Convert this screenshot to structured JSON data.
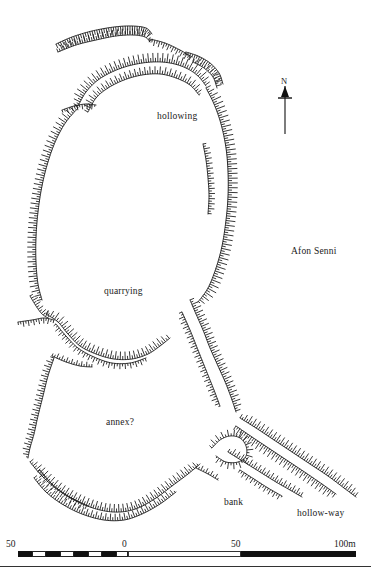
{
  "figure": {
    "kind": "archaeological-earthwork-survey-plan",
    "width": 371,
    "height": 574,
    "background_color": "#ffffff",
    "ink_color": "#111111"
  },
  "labels": [
    {
      "name": "hollowing",
      "text": "hollowing",
      "x": 157,
      "y": 111
    },
    {
      "name": "afon-senni",
      "text": "Afon Senni",
      "x": 291,
      "y": 246
    },
    {
      "name": "quarrying",
      "text": "quarrying",
      "x": 104,
      "y": 286
    },
    {
      "name": "annex",
      "text": "annex?",
      "x": 106,
      "y": 417
    },
    {
      "name": "bank",
      "text": "bank",
      "x": 224,
      "y": 497
    },
    {
      "name": "hollow-way",
      "text": "hollow-way",
      "x": 297,
      "y": 508
    }
  ],
  "north_arrow": {
    "label": "N",
    "label_x": 281,
    "label_y": 76,
    "shaft_x": 285,
    "shaft_top": 86,
    "shaft_bottom": 134,
    "head_half_width": 4,
    "head_height": 11,
    "crossbar_y": 98,
    "crossbar_half_width": 7
  },
  "scale_bar": {
    "unit_suffix": "m",
    "ticks": [
      {
        "text": "50",
        "x": 6,
        "y": 539
      },
      {
        "text": "0",
        "x": 122,
        "y": 539
      },
      {
        "text": "50",
        "x": 231,
        "y": 539
      },
      {
        "text": "100m",
        "x": 334,
        "y": 539
      }
    ],
    "bar_left": 18,
    "bar_width": 338,
    "bar_top": 551,
    "bar_height": 6,
    "segments": [
      {
        "style": "black",
        "left": 0,
        "width": 14
      },
      {
        "style": "white",
        "left": 14,
        "width": 14
      },
      {
        "style": "black",
        "left": 28,
        "width": 14
      },
      {
        "style": "white",
        "left": 42,
        "width": 14
      },
      {
        "style": "black",
        "left": 56,
        "width": 14
      },
      {
        "style": "white",
        "left": 70,
        "width": 14
      },
      {
        "style": "black",
        "left": 84,
        "width": 14
      },
      {
        "style": "white",
        "left": 98,
        "width": 12
      },
      {
        "style": "outline",
        "left": 110,
        "width": 113
      },
      {
        "style": "black",
        "left": 223,
        "width": 115
      }
    ]
  },
  "hachure_style": {
    "stroke_color": "#151515",
    "baseline_width": 0.9,
    "tick_width": 0.85,
    "default_spacing": 2.6,
    "default_tick_length": 7
  },
  "earthworks": [
    {
      "name": "north-outer-bank",
      "side": -1,
      "spacing": 2.4,
      "tick": 8,
      "taper": 0.55,
      "baseline": [
        [
          56,
          44
        ],
        [
          72,
          37
        ],
        [
          92,
          31
        ],
        [
          114,
          27
        ],
        [
          132,
          26
        ],
        [
          146,
          28
        ],
        [
          152,
          34
        ]
      ]
    },
    {
      "name": "north-outer-bank-lower",
      "side": 1,
      "spacing": 2.4,
      "tick": 6.5,
      "taper": 0.6,
      "baseline": [
        [
          58,
          52
        ],
        [
          76,
          45
        ],
        [
          96,
          40
        ],
        [
          116,
          36
        ],
        [
          133,
          35
        ],
        [
          145,
          37
        ],
        [
          150,
          42
        ]
      ]
    },
    {
      "name": "north-spur-east",
      "side": -1,
      "spacing": 2.5,
      "tick": 6,
      "taper": 0.5,
      "baseline": [
        [
          150,
          39
        ],
        [
          165,
          43
        ],
        [
          180,
          50
        ],
        [
          192,
          57
        ]
      ]
    },
    {
      "name": "north-inner-rampart-outer",
      "side": 1,
      "spacing": 2.3,
      "tick": 9,
      "taper": 0.45,
      "baseline": [
        [
          78,
          106
        ],
        [
          86,
          92
        ],
        [
          98,
          80
        ],
        [
          114,
          71
        ],
        [
          132,
          65
        ],
        [
          152,
          62
        ],
        [
          170,
          63
        ],
        [
          186,
          68
        ],
        [
          198,
          76
        ],
        [
          206,
          86
        ]
      ]
    },
    {
      "name": "north-inner-rampart-inner",
      "side": 1,
      "spacing": 2.4,
      "tick": 7.5,
      "taper": 0.5,
      "baseline": [
        [
          88,
          112
        ],
        [
          96,
          98
        ],
        [
          108,
          88
        ],
        [
          124,
          80
        ],
        [
          142,
          75
        ],
        [
          160,
          74
        ],
        [
          176,
          78
        ],
        [
          190,
          85
        ],
        [
          199,
          95
        ]
      ]
    },
    {
      "name": "north-east-scarp",
      "side": -1,
      "spacing": 2.4,
      "tick": 6.5,
      "taper": 0.5,
      "baseline": [
        [
          186,
          52
        ],
        [
          198,
          56
        ],
        [
          210,
          63
        ],
        [
          219,
          73
        ],
        [
          223,
          84
        ]
      ]
    },
    {
      "name": "north-east-scarp-inner",
      "side": 1,
      "spacing": 2.5,
      "tick": 5.5,
      "taper": 0.5,
      "baseline": [
        [
          193,
          62
        ],
        [
          204,
          68
        ],
        [
          213,
          77
        ],
        [
          217,
          88
        ]
      ]
    },
    {
      "name": "northwest-short-scarp",
      "side": -1,
      "spacing": 2.6,
      "tick": 5,
      "taper": 0.5,
      "baseline": [
        [
          62,
          110
        ],
        [
          74,
          106
        ],
        [
          86,
          104
        ],
        [
          96,
          105
        ]
      ]
    },
    {
      "name": "west-rampart",
      "side": -1,
      "spacing": 2.4,
      "tick": 8.5,
      "taper": 0.4,
      "baseline": [
        [
          78,
          108
        ],
        [
          66,
          122
        ],
        [
          56,
          140
        ],
        [
          48,
          162
        ],
        [
          42,
          186
        ],
        [
          38,
          212
        ],
        [
          36,
          238
        ],
        [
          36,
          262
        ],
        [
          38,
          284
        ],
        [
          42,
          300
        ]
      ]
    },
    {
      "name": "east-rampart",
      "side": 1,
      "spacing": 2.35,
      "tick": 9.5,
      "taper": 0.4,
      "baseline": [
        [
          206,
          88
        ],
        [
          214,
          104
        ],
        [
          221,
          124
        ],
        [
          226,
          148
        ],
        [
          228,
          172
        ],
        [
          228,
          196
        ],
        [
          226,
          220
        ],
        [
          222,
          246
        ],
        [
          216,
          268
        ],
        [
          208,
          288
        ],
        [
          198,
          302
        ]
      ]
    },
    {
      "name": "east-inner-scarp",
      "side": 1,
      "spacing": 2.5,
      "tick": 6,
      "taper": 0.5,
      "baseline": [
        [
          203,
          144
        ],
        [
          206,
          160
        ],
        [
          208,
          178
        ],
        [
          209,
          196
        ],
        [
          208,
          214
        ]
      ]
    },
    {
      "name": "south-west-scarp",
      "side": 1,
      "spacing": 2.6,
      "tick": 6,
      "taper": 0.5,
      "baseline": [
        [
          30,
          296
        ],
        [
          36,
          306
        ],
        [
          42,
          314
        ],
        [
          48,
          318
        ]
      ]
    },
    {
      "name": "quarry-scarp-west",
      "side": -1,
      "spacing": 2.6,
      "tick": 5.5,
      "taper": 0.5,
      "baseline": [
        [
          18,
          322
        ],
        [
          32,
          320
        ],
        [
          44,
          318
        ],
        [
          54,
          320
        ]
      ]
    },
    {
      "name": "annex-north-bank",
      "side": 1,
      "spacing": 2.5,
      "tick": 8,
      "taper": 0.45,
      "baseline": [
        [
          46,
          314
        ],
        [
          58,
          322
        ],
        [
          68,
          334
        ],
        [
          80,
          346
        ],
        [
          96,
          354
        ],
        [
          114,
          359
        ],
        [
          132,
          359
        ],
        [
          148,
          354
        ],
        [
          160,
          346
        ],
        [
          170,
          338
        ]
      ]
    },
    {
      "name": "annex-north-bank-outer",
      "side": -1,
      "spacing": 2.6,
      "tick": 5.5,
      "taper": 0.5,
      "baseline": [
        [
          56,
          324
        ],
        [
          66,
          336
        ],
        [
          78,
          348
        ],
        [
          94,
          357
        ],
        [
          112,
          363
        ],
        [
          130,
          363
        ],
        [
          146,
          358
        ]
      ]
    },
    {
      "name": "annex-north-west-spur",
      "side": 1,
      "spacing": 2.6,
      "tick": 5,
      "taper": 0.5,
      "baseline": [
        [
          52,
          356
        ],
        [
          66,
          362
        ],
        [
          80,
          366
        ],
        [
          92,
          367
        ]
      ]
    },
    {
      "name": "annex-east-bank",
      "side": 1,
      "spacing": 2.4,
      "tick": 8,
      "taper": 0.45,
      "baseline": [
        [
          190,
          300
        ],
        [
          196,
          314
        ],
        [
          203,
          330
        ],
        [
          210,
          348
        ],
        [
          218,
          366
        ],
        [
          226,
          384
        ],
        [
          232,
          400
        ],
        [
          236,
          412
        ]
      ]
    },
    {
      "name": "annex-east-bank-inner",
      "side": -1,
      "spacing": 2.6,
      "tick": 6,
      "taper": 0.5,
      "baseline": [
        [
          182,
          312
        ],
        [
          190,
          330
        ],
        [
          198,
          350
        ],
        [
          206,
          370
        ],
        [
          214,
          390
        ],
        [
          220,
          406
        ]
      ]
    },
    {
      "name": "annex-west-bank",
      "side": -1,
      "spacing": 2.5,
      "tick": 7,
      "taper": 0.5,
      "baseline": [
        [
          54,
          358
        ],
        [
          48,
          376
        ],
        [
          43,
          396
        ],
        [
          38,
          416
        ],
        [
          34,
          434
        ],
        [
          30,
          448
        ],
        [
          28,
          458
        ]
      ]
    },
    {
      "name": "annex-south-bank-inner",
      "side": 1,
      "spacing": 2.4,
      "tick": 8,
      "taper": 0.45,
      "baseline": [
        [
          30,
          462
        ],
        [
          42,
          476
        ],
        [
          58,
          490
        ],
        [
          78,
          502
        ],
        [
          100,
          510
        ],
        [
          120,
          512
        ],
        [
          138,
          508
        ],
        [
          156,
          498
        ],
        [
          172,
          486
        ],
        [
          188,
          474
        ],
        [
          200,
          464
        ]
      ]
    },
    {
      "name": "annex-south-bank-outer",
      "side": 1,
      "spacing": 2.5,
      "tick": 7,
      "taper": 0.5,
      "baseline": [
        [
          34,
          478
        ],
        [
          46,
          492
        ],
        [
          62,
          504
        ],
        [
          82,
          514
        ],
        [
          104,
          520
        ],
        [
          124,
          520
        ],
        [
          142,
          514
        ],
        [
          160,
          504
        ],
        [
          176,
          492
        ]
      ]
    },
    {
      "name": "annex-south-outer-fragment",
      "side": -1,
      "spacing": 2.7,
      "tick": 5.5,
      "taper": 0.5,
      "baseline": [
        [
          40,
          470
        ],
        [
          52,
          484
        ],
        [
          68,
          496
        ],
        [
          88,
          506
        ]
      ]
    },
    {
      "name": "bank-node-radial",
      "side": 1,
      "spacing": 2.6,
      "tick": 6.5,
      "taper": 0.4,
      "baseline": [
        [
          212,
          448
        ],
        [
          220,
          440
        ],
        [
          230,
          436
        ],
        [
          240,
          438
        ],
        [
          246,
          446
        ],
        [
          246,
          456
        ],
        [
          238,
          462
        ],
        [
          226,
          462
        ],
        [
          216,
          456
        ]
      ]
    },
    {
      "name": "hollow-way-north-bank",
      "side": 1,
      "spacing": 2.4,
      "tick": 8,
      "taper": 0.45,
      "baseline": [
        [
          240,
          418
        ],
        [
          256,
          428
        ],
        [
          274,
          440
        ],
        [
          292,
          452
        ],
        [
          310,
          464
        ],
        [
          328,
          476
        ],
        [
          344,
          488
        ],
        [
          356,
          497
        ]
      ]
    },
    {
      "name": "hollow-way-middle-bank",
      "side": -1,
      "spacing": 2.4,
      "tick": 8,
      "taper": 0.45,
      "baseline": [
        [
          236,
          426
        ],
        [
          252,
          437
        ],
        [
          270,
          449
        ],
        [
          288,
          461
        ],
        [
          306,
          473
        ],
        [
          322,
          484
        ],
        [
          336,
          494
        ]
      ]
    },
    {
      "name": "hollow-way-south-bank",
      "side": 1,
      "spacing": 2.5,
      "tick": 6.5,
      "taper": 0.5,
      "baseline": [
        [
          228,
          452
        ],
        [
          244,
          462
        ],
        [
          260,
          472
        ],
        [
          276,
          482
        ],
        [
          290,
          490
        ],
        [
          302,
          497
        ]
      ]
    },
    {
      "name": "hollow-way-south-outer",
      "side": -1,
      "spacing": 2.6,
      "tick": 5.5,
      "taper": 0.5,
      "baseline": [
        [
          240,
          470
        ],
        [
          254,
          479
        ],
        [
          268,
          488
        ],
        [
          282,
          496
        ]
      ]
    },
    {
      "name": "bank-short-west",
      "side": 1,
      "spacing": 2.7,
      "tick": 5,
      "taper": 0.5,
      "baseline": [
        [
          196,
          468
        ],
        [
          208,
          474
        ],
        [
          218,
          480
        ]
      ]
    }
  ]
}
